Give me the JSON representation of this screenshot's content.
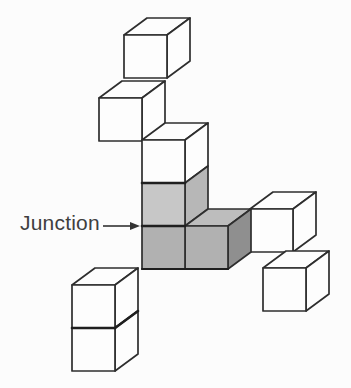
{
  "figure": {
    "type": "cube-structure-diagram",
    "background": "#fcfcfc"
  },
  "label": {
    "text": "Junction",
    "color": "#3f3f3f"
  },
  "arrow": {
    "x1": 103,
    "y1": 226,
    "x2": 131,
    "y2": 226,
    "tip_x": 140,
    "tip_y": 226,
    "head_back_x": 130,
    "head_half_h": 4,
    "color": "#333333",
    "width": 1.6
  },
  "diagram": {
    "canvas": {
      "width": 351,
      "height": 388
    },
    "line_color": "#2e2e2e",
    "line_width": 1.7,
    "bold_line_color": "#1f1f1f",
    "cube_size": 43,
    "depth": {
      "dx": 23,
      "dy": 17
    },
    "cubes": [
      {
        "name": "top-cube",
        "x": 124,
        "y": 35,
        "front": "#fdfdfd",
        "top": "#fdfdfd",
        "right": "#fdfdfd"
      },
      {
        "name": "upper-left-cube",
        "x": 99,
        "y": 98,
        "front": "#fdfdfd",
        "top": "#fdfdfd",
        "right": "#fdfdfd"
      },
      {
        "name": "column-top-cube",
        "x": 142,
        "y": 140,
        "front": "#fdfdfd",
        "top": "#fdfdfd",
        "right": "#fdfdfd"
      },
      {
        "name": "shaded-upper-cube",
        "x": 142,
        "y": 183,
        "front": "#c7c7c7",
        "top": null,
        "right": "#b7b7b7"
      },
      {
        "name": "right-upper-white-cube",
        "x": 250,
        "y": 209,
        "front": "#fdfdfd",
        "top": "#fdfdfd",
        "right": "#fdfdfd"
      },
      {
        "name": "shaded-right-cube",
        "x": 185,
        "y": 226,
        "front": "#b1b1b1",
        "top": "#bdbdbd",
        "right": "#8f8f8f"
      },
      {
        "name": "junction-cube",
        "x": 142,
        "y": 226,
        "front": "#b1b1b1",
        "top": null,
        "right": null
      },
      {
        "name": "right-lower-white-cube",
        "x": 263,
        "y": 268,
        "front": "#fdfdfd",
        "top": "#fdfdfd",
        "right": "#fdfdfd"
      },
      {
        "name": "bottom-stack-top-cube",
        "x": 72,
        "y": 285,
        "front": "#fdfdfd",
        "top": "#fdfdfd",
        "right": "#fdfdfd"
      },
      {
        "name": "bottom-stack-bottom-cube",
        "x": 72,
        "y": 328,
        "front": "#fdfdfd",
        "top": null,
        "right": "#fdfdfd"
      }
    ],
    "bold_edges": [
      {
        "name": "column-shading-boundary",
        "x1": 142,
        "y1": 183,
        "x2": 185,
        "y2": 183,
        "w": 2.6
      },
      {
        "name": "junction-edge",
        "x1": 142,
        "y1": 226,
        "x2": 185,
        "y2": 226,
        "w": 2.6
      },
      {
        "name": "shaded-bottom-edge",
        "x1": 142,
        "y1": 269,
        "x2": 228,
        "y2": 269,
        "w": 2.2
      },
      {
        "name": "stack-boundary-front",
        "x1": 72,
        "y1": 328,
        "x2": 115,
        "y2": 328,
        "w": 2.6
      },
      {
        "name": "stack-boundary-side",
        "x1": 115,
        "y1": 328,
        "x2": 138,
        "y2": 311,
        "w": 2.6
      }
    ]
  }
}
